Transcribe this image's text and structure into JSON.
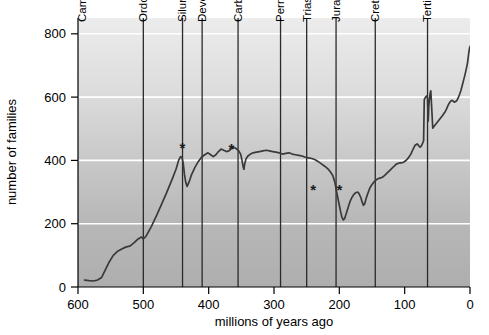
{
  "chart_data": {
    "type": "line",
    "title": "",
    "xlabel": "millions of years ago",
    "ylabel": "number of families",
    "xlim": [
      600,
      0
    ],
    "ylim": [
      0,
      850
    ],
    "x_ticks": [
      600,
      500,
      400,
      300,
      200,
      100,
      0
    ],
    "y_ticks": [
      0,
      200,
      400,
      600,
      800
    ],
    "x_reversed": true,
    "grid": "horizontal-white-gridlines",
    "legend": "none",
    "background": "vertical gray gradient, light at top to darker at bottom",
    "series": [
      {
        "name": "marine animal families",
        "points": [
          [
            590,
            22
          ],
          [
            583,
            20
          ],
          [
            576,
            19
          ],
          [
            570,
            22
          ],
          [
            564,
            30
          ],
          [
            558,
            55
          ],
          [
            552,
            80
          ],
          [
            546,
            100
          ],
          [
            540,
            112
          ],
          [
            533,
            120
          ],
          [
            527,
            126
          ],
          [
            520,
            130
          ],
          [
            514,
            140
          ],
          [
            508,
            152
          ],
          [
            503,
            158
          ],
          [
            500,
            152
          ],
          [
            496,
            160
          ],
          [
            488,
            190
          ],
          [
            480,
            225
          ],
          [
            472,
            262
          ],
          [
            464,
            300
          ],
          [
            456,
            340
          ],
          [
            450,
            372
          ],
          [
            446,
            400
          ],
          [
            443,
            412
          ],
          [
            441,
            410
          ],
          [
            439,
            392
          ],
          [
            437,
            355
          ],
          [
            435,
            330
          ],
          [
            433,
            318
          ],
          [
            430,
            332
          ],
          [
            426,
            356
          ],
          [
            421,
            378
          ],
          [
            416,
            396
          ],
          [
            411,
            410
          ],
          [
            406,
            418
          ],
          [
            401,
            424
          ],
          [
            397,
            418
          ],
          [
            393,
            412
          ],
          [
            389,
            418
          ],
          [
            385,
            428
          ],
          [
            381,
            436
          ],
          [
            377,
            432
          ],
          [
            373,
            428
          ],
          [
            369,
            430
          ],
          [
            366,
            436
          ],
          [
            363,
            440
          ],
          [
            360,
            440
          ],
          [
            357,
            436
          ],
          [
            354,
            430
          ],
          [
            351,
            420
          ],
          [
            349,
            400
          ],
          [
            347,
            378
          ],
          [
            346,
            372
          ],
          [
            345,
            388
          ],
          [
            343,
            404
          ],
          [
            340,
            414
          ],
          [
            336,
            420
          ],
          [
            332,
            424
          ],
          [
            327,
            426
          ],
          [
            322,
            428
          ],
          [
            317,
            430
          ],
          [
            312,
            432
          ],
          [
            307,
            430
          ],
          [
            302,
            428
          ],
          [
            297,
            426
          ],
          [
            292,
            424
          ],
          [
            287,
            420
          ],
          [
            282,
            422
          ],
          [
            277,
            424
          ],
          [
            272,
            420
          ],
          [
            267,
            418
          ],
          [
            262,
            416
          ],
          [
            257,
            414
          ],
          [
            252,
            410
          ],
          [
            247,
            408
          ],
          [
            242,
            406
          ],
          [
            237,
            402
          ],
          [
            232,
            396
          ],
          [
            228,
            390
          ],
          [
            224,
            384
          ],
          [
            220,
            378
          ],
          [
            216,
            370
          ],
          [
            213,
            362
          ],
          [
            210,
            352
          ],
          [
            207,
            332
          ],
          [
            204,
            300
          ],
          [
            201,
            268
          ],
          [
            198,
            238
          ],
          [
            196,
            220
          ],
          [
            194,
            212
          ],
          [
            192,
            216
          ],
          [
            190,
            228
          ],
          [
            187,
            248
          ],
          [
            184,
            268
          ],
          [
            181,
            282
          ],
          [
            178,
            292
          ],
          [
            175,
            298
          ],
          [
            172,
            300
          ],
          [
            170,
            296
          ],
          [
            167,
            282
          ],
          [
            165,
            268
          ],
          [
            163,
            258
          ],
          [
            161,
            264
          ],
          [
            159,
            280
          ],
          [
            156,
            298
          ],
          [
            153,
            314
          ],
          [
            150,
            324
          ],
          [
            147,
            332
          ],
          [
            144,
            338
          ],
          [
            141,
            342
          ],
          [
            138,
            344
          ],
          [
            135,
            346
          ],
          [
            132,
            350
          ],
          [
            129,
            356
          ],
          [
            126,
            362
          ],
          [
            123,
            368
          ],
          [
            120,
            374
          ],
          [
            117,
            380
          ],
          [
            114,
            386
          ],
          [
            111,
            390
          ],
          [
            108,
            392
          ],
          [
            105,
            392
          ],
          [
            102,
            394
          ],
          [
            99,
            398
          ],
          [
            96,
            404
          ],
          [
            93,
            412
          ],
          [
            90,
            422
          ],
          [
            87,
            436
          ],
          [
            84,
            448
          ],
          [
            81,
            452
          ],
          [
            79,
            448
          ],
          [
            77,
            442
          ],
          [
            75,
            444
          ],
          [
            73,
            452
          ],
          [
            71,
            462
          ],
          [
            69,
            468
          ],
          [
            67,
            472
          ],
          [
            65,
            478
          ],
          [
            62,
            486
          ],
          [
            60,
            494
          ],
          [
            57,
            502
          ],
          [
            54,
            510
          ],
          [
            51,
            518
          ],
          [
            48,
            526
          ],
          [
            45,
            534
          ],
          [
            42,
            542
          ],
          [
            40,
            548
          ],
          [
            38,
            554
          ],
          [
            36,
            562
          ],
          [
            34,
            572
          ],
          [
            32,
            580
          ],
          [
            30,
            586
          ],
          [
            28,
            590
          ],
          [
            26,
            588
          ],
          [
            24,
            584
          ],
          [
            22,
            586
          ],
          [
            20,
            590
          ],
          [
            18,
            598
          ],
          [
            16,
            608
          ],
          [
            14,
            620
          ],
          [
            12,
            636
          ],
          [
            10,
            652
          ],
          [
            8,
            668
          ],
          [
            6,
            686
          ],
          [
            4,
            706
          ],
          [
            3,
            722
          ],
          [
            2,
            738
          ],
          [
            1,
            752
          ],
          [
            0,
            760
          ]
        ]
      }
    ],
    "k_t_detail": [
      [
        70,
        592
      ],
      [
        68,
        600
      ],
      [
        66,
        604
      ],
      [
        65,
        596
      ],
      [
        64.5,
        560
      ],
      [
        64,
        524
      ],
      [
        63.5,
        544
      ],
      [
        63,
        572
      ],
      [
        62,
        596
      ],
      [
        61,
        612
      ],
      [
        60,
        620
      ]
    ],
    "annotations": [
      {
        "label": "*",
        "x": 440,
        "y": 424,
        "name": "ordovician-silurian-extinction"
      },
      {
        "label": "*",
        "x": 365,
        "y": 420,
        "name": "late-devonian-extinction"
      },
      {
        "label": "*",
        "x": 240,
        "y": 290,
        "name": "permian-triassic-extinction"
      },
      {
        "label": "*",
        "x": 200,
        "y": 292,
        "name": "triassic-jurassic-extinction"
      }
    ],
    "period_boundaries": [
      {
        "label": "Cambrian",
        "line_at": 600,
        "text_at": 588
      },
      {
        "label": "Ordovician",
        "line_at": 500,
        "text_at": 494
      },
      {
        "label": "Silurian",
        "line_at": 440,
        "text_at": 434
      },
      {
        "label": "Devonian",
        "line_at": 410,
        "text_at": 404
      },
      {
        "label": "Carboniferous",
        "line_at": 355,
        "text_at": 349
      },
      {
        "label": "Permian",
        "line_at": 290,
        "text_at": 284
      },
      {
        "label": "Triassic",
        "line_at": 250,
        "text_at": 244
      },
      {
        "label": "Jurassic",
        "line_at": 205,
        "text_at": 199
      },
      {
        "label": "Cretaceous",
        "line_at": 145,
        "text_at": 139
      },
      {
        "label": "Tertiary",
        "line_at": 65,
        "text_at": 59
      }
    ],
    "colors": {
      "line": "#3a3a3a",
      "boundary_line": "#2a2a2a",
      "gridline": "#ffffff",
      "bg_top": "#e9e9e9",
      "bg_bottom": "#adadad",
      "text": "#000000"
    }
  }
}
